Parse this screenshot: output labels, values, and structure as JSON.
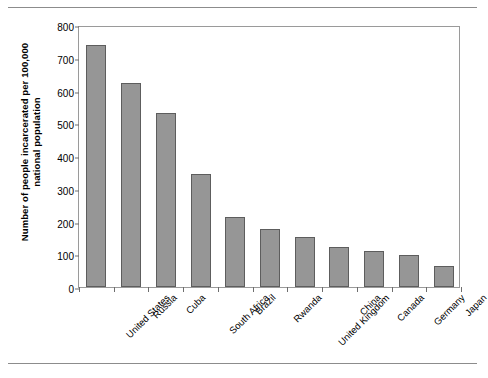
{
  "chart_data": {
    "type": "bar",
    "title": "",
    "xlabel": "",
    "ylabel": "Number of people incarcerated per 100,000\nnational population",
    "ylim": [
      0,
      800
    ],
    "ytick_values": [
      0,
      100,
      200,
      300,
      400,
      500,
      600,
      700,
      800
    ],
    "ytick_labels": [
      "0",
      "100",
      "200",
      "300",
      "400",
      "500",
      "600",
      "700",
      "800"
    ],
    "grid": false,
    "legend": "none",
    "bar_color": "#969696",
    "bar_border_color": "#5d5d5d",
    "categories": [
      "United States",
      "Russia",
      "Cuba",
      "South Africa",
      "Brazil",
      "Rwanda",
      "United Kingdom",
      "China",
      "Canada",
      "Germany",
      "Japan"
    ],
    "values": [
      738,
      623,
      531,
      344,
      214,
      176,
      152,
      122,
      110,
      98,
      65
    ]
  }
}
